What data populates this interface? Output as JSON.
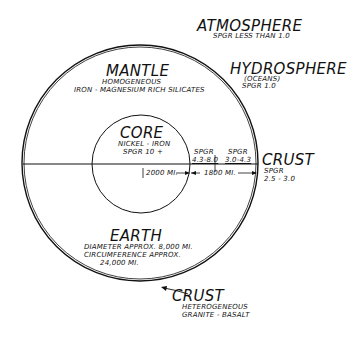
{
  "atmosphere": {
    "title": "ATMOSPHERE",
    "sub": "SpGr LESS THAN 1.0"
  },
  "hydrosphere": {
    "title": "HYDROSPHERE",
    "sub1": "(OCEANS)",
    "sub2": "SpGr 1.0"
  },
  "mantle": {
    "title": "MANTLE",
    "sub1": "HOMOGENEOUS",
    "sub2": "IRON - MAGNESIUM RICH SILICATES"
  },
  "core": {
    "title": "CORE",
    "sub1": "NICKEL - IRON",
    "sub2": "SpGr 10 +"
  },
  "inner_mantle_spgr": {
    "label": "SpGr",
    "value": "4.3-8.0"
  },
  "outer_mantle_spgr": {
    "label": "SpGr",
    "value": "3.0-4.3"
  },
  "crust_right": {
    "title": "CRUST",
    "label": "SpGr",
    "value": "2.5 - 3.0"
  },
  "dimensions": {
    "core_radius": "2000 MI.",
    "mantle_thickness": "1800 MI."
  },
  "earth": {
    "title": "EARTH",
    "line1": "DIAMETER APPROX. 8,000 MI.",
    "line2": "CIRCUMFERENCE APPROX.",
    "line3": "24,000 MI."
  },
  "crust_bottom": {
    "title": "CRUST",
    "sub1": "HETEROGENEOUS",
    "sub2": "GRANITE - BASALT"
  }
}
